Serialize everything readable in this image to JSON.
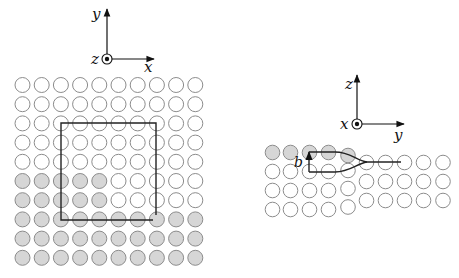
{
  "colors": {
    "atom_stroke": "#8c8c8c",
    "atom_fill_shaded": "#d6d6d6",
    "atom_fill_empty": "#ffffff",
    "line": "#222222"
  },
  "left_panel": {
    "axes": {
      "origin": [
        107,
        59
      ],
      "vertical_label": "y",
      "horizontal_label": "x",
      "out_of_plane_label": "z"
    },
    "lattice": {
      "rows": 10,
      "cols": 10,
      "x0": 22.5,
      "y0": 85,
      "pitch_x": 19.2,
      "pitch_y": 19.2,
      "r": 7.5,
      "shaded": [
        [
          0,
          0,
          0,
          0,
          0,
          0,
          0,
          0,
          0,
          0
        ],
        [
          0,
          0,
          0,
          0,
          0,
          0,
          0,
          0,
          0,
          0
        ],
        [
          0,
          0,
          0,
          0,
          0,
          0,
          0,
          0,
          0,
          0
        ],
        [
          0,
          0,
          0,
          0,
          0,
          0,
          0,
          0,
          0,
          0
        ],
        [
          0,
          0,
          0,
          0,
          0,
          0,
          0,
          0,
          0,
          0
        ],
        [
          1,
          1,
          1,
          1,
          1,
          0,
          0,
          0,
          0,
          0
        ],
        [
          1,
          1,
          1,
          1,
          1,
          0,
          0,
          0,
          0,
          0
        ],
        [
          1,
          1,
          1,
          1,
          1,
          1,
          1,
          1,
          1,
          1
        ],
        [
          1,
          1,
          1,
          1,
          1,
          1,
          1,
          1,
          1,
          1
        ],
        [
          1,
          1,
          1,
          1,
          1,
          1,
          1,
          1,
          1,
          1
        ]
      ]
    },
    "burgers_circuit": {
      "left": 61,
      "top": 123,
      "right": 156,
      "bottom": 220,
      "gap_right_end_y": 215,
      "gap_bottom_end_x": 153
    }
  },
  "right_panel": {
    "axes": {
      "origin": [
        357,
        124
      ],
      "vertical_label": "z",
      "horizontal_label": "y",
      "out_of_plane_label": "x"
    },
    "left_block": {
      "cols_x": [
        272.5,
        290.5,
        309.5,
        328.5
      ],
      "rows_y": [
        152.5,
        171.5,
        190.5,
        209.5
      ],
      "shaded_row": 0
    },
    "core_column": {
      "x": 348,
      "rows_y": [
        155.5,
        170.5,
        188.5,
        207
      ],
      "shaded_row": 0
    },
    "right_block": {
      "cols_x": [
        366.5,
        385.5,
        404.5,
        423.5,
        443
      ],
      "rows_y": [
        162.5,
        181.5,
        200.5
      ]
    },
    "burgers_vector_label": "b"
  }
}
